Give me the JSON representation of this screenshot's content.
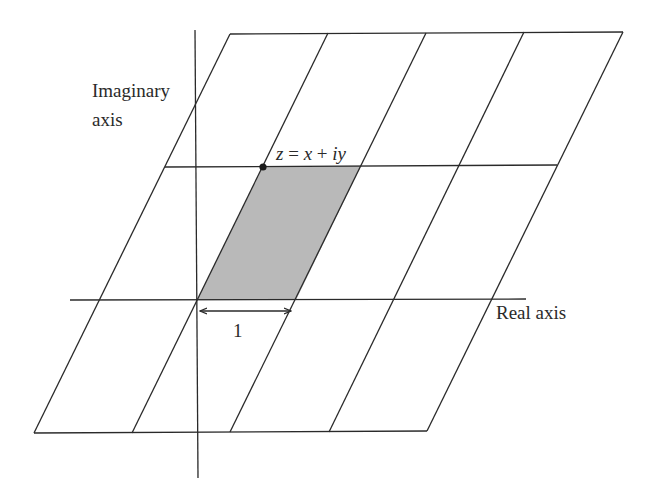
{
  "figure": {
    "labels": {
      "imaginary_axis_line1": "Imaginary",
      "imaginary_axis_line2": "axis",
      "real_axis": "Real axis",
      "point_z": "z",
      "point_eq": " = ",
      "point_x": "x",
      "point_plus": " + ",
      "point_iy": "iy",
      "unit_length": "1"
    },
    "colors": {
      "line": "#2a2a2a",
      "shaded_cell": "#b9b9b9",
      "background": "#ffffff"
    },
    "lattice": {
      "rows": 3,
      "columns": 4,
      "shaded_cell": "origin cell spanned by 1 and z"
    }
  }
}
